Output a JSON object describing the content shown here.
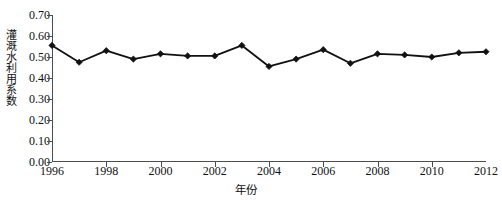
{
  "chart_data": {
    "type": "line",
    "title": "",
    "subtitle": "",
    "xlabel": "年份",
    "ylabel": "灌溉水利用系数",
    "xlim": [
      1996,
      2012
    ],
    "ylim": [
      0.0,
      0.7
    ],
    "grid": false,
    "legend": null,
    "legend_position": "none",
    "marker": "diamond",
    "line_color": "#111111",
    "marker_color": "#111111",
    "x": [
      1996,
      1997,
      1998,
      1999,
      2000,
      2001,
      2002,
      2003,
      2004,
      2005,
      2006,
      2007,
      2008,
      2009,
      2010,
      2011,
      2012
    ],
    "values": [
      0.555,
      0.475,
      0.53,
      0.49,
      0.515,
      0.505,
      0.505,
      0.555,
      0.455,
      0.49,
      0.535,
      0.47,
      0.515,
      0.51,
      0.5,
      0.52,
      0.525
    ],
    "series": [
      {
        "name": "灌溉水利用系数",
        "values": [
          0.555,
          0.475,
          0.53,
          0.49,
          0.515,
          0.505,
          0.505,
          0.555,
          0.455,
          0.49,
          0.535,
          0.47,
          0.515,
          0.51,
          0.5,
          0.52,
          0.525
        ]
      }
    ],
    "x_tick_labels": [
      "1996",
      "1998",
      "2000",
      "2002",
      "2004",
      "2006",
      "2008",
      "2010",
      "2012"
    ],
    "x_tick_values": [
      1996,
      1998,
      2000,
      2002,
      2004,
      2006,
      2008,
      2010,
      2012
    ],
    "y_tick_labels": [
      "0.00",
      "0.10",
      "0.20",
      "0.30",
      "0.40",
      "0.50",
      "0.60",
      "0.70"
    ],
    "y_tick_values": [
      0.0,
      0.1,
      0.2,
      0.3,
      0.4,
      0.5,
      0.6,
      0.7
    ]
  }
}
